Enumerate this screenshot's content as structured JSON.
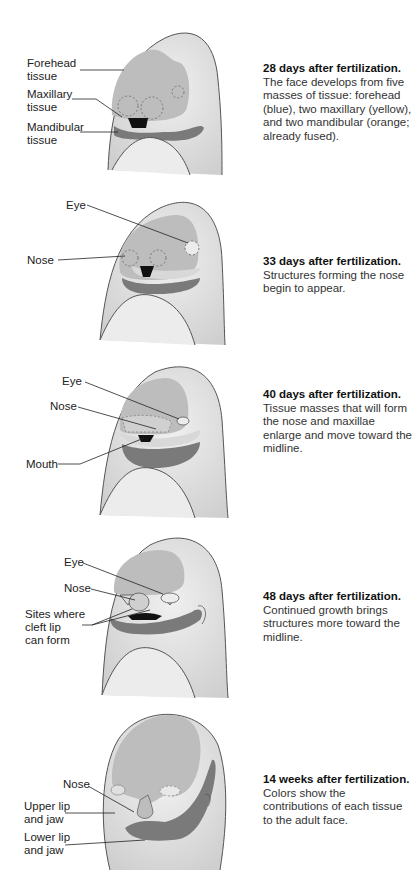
{
  "stages": [
    {
      "id": "28-days",
      "heading": "28 days after fertilization.",
      "description": "The face develops from five masses of tissue: forehead (blue), two maxillary (yellow), and two mandibular (orange; already fused).",
      "labels": [
        "Forehead\ntissue",
        "Maxillary\ntissue",
        "Mandibular\ntissue"
      ]
    },
    {
      "id": "33-days",
      "heading": "33 days after fertilization.",
      "description": "Structures forming the nose begin to appear.",
      "labels": [
        "Eye",
        "Nose"
      ]
    },
    {
      "id": "40-days",
      "heading": "40 days after fertilization.",
      "description": "Tissue masses that will form the nose and maxillae enlarge and move toward the midline.",
      "labels": [
        "Eye",
        "Nose",
        "Mouth"
      ]
    },
    {
      "id": "48-days",
      "heading": "48 days after fertilization.",
      "description": "Continued growth brings structures more toward the midline.",
      "labels": [
        "Eye",
        "Nose",
        "Sites where\ncleft lip\ncan form"
      ]
    },
    {
      "id": "14-weeks",
      "heading": "14 weeks after fertilization.",
      "description": "Colors show the contributions of each tissue to the adult face.",
      "labels": [
        "Nose",
        "Upper lip\nand jaw",
        "Lower lip\nand jaw"
      ]
    }
  ],
  "colors": {
    "skin": "#e4e4e4",
    "forehead_tissue": "#bdbdbd",
    "maxillary_tissue": "#d6d6d6",
    "mandibular_tissue": "#7a7a7a",
    "mouth": "#111111",
    "outline": "#555555"
  }
}
